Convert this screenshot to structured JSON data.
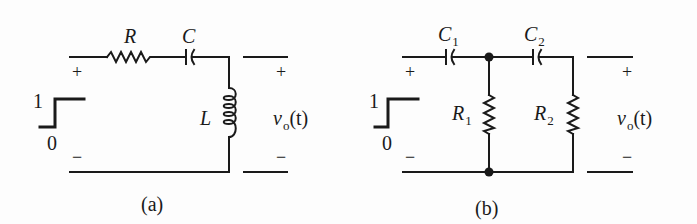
{
  "figure": {
    "panels": [
      {
        "id": "a",
        "caption": "(a)",
        "source": {
          "high_label": "1",
          "low_label": "0",
          "plus": "+",
          "minus": "−"
        },
        "components": [
          {
            "type": "resistor",
            "label": "R",
            "sub": ""
          },
          {
            "type": "capacitor",
            "label": "C",
            "sub": ""
          },
          {
            "type": "inductor",
            "label": "L",
            "sub": ""
          }
        ],
        "output": {
          "label_main": "v",
          "label_sub": "o",
          "label_arg": "(t)",
          "plus": "+",
          "minus": "−"
        }
      },
      {
        "id": "b",
        "caption": "(b)",
        "source": {
          "high_label": "1",
          "low_label": "0",
          "plus": "+",
          "minus": "−"
        },
        "components": [
          {
            "type": "capacitor",
            "label": "C",
            "sub": "1"
          },
          {
            "type": "capacitor",
            "label": "C",
            "sub": "2"
          },
          {
            "type": "resistor",
            "label": "R",
            "sub": "1"
          },
          {
            "type": "resistor",
            "label": "R",
            "sub": "2"
          }
        ],
        "output": {
          "label_main": "v",
          "label_sub": "o",
          "label_arg": "(t)",
          "plus": "+",
          "minus": "−"
        }
      }
    ],
    "colors": {
      "ink": "#1a1a1a",
      "background": "#fdfdfd"
    }
  }
}
